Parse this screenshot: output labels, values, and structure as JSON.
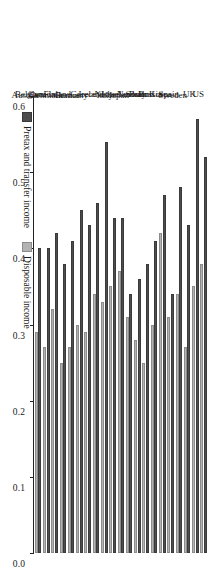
{
  "chart_data": {
    "type": "bar",
    "orientation": "horizontal",
    "title": "",
    "subtitle": "",
    "xlabel": "",
    "ylabel": "",
    "xlim": [
      0.0,
      0.6
    ],
    "xticks": [
      "0.0",
      "0.1",
      "0.2",
      "0.3",
      "0.4",
      "0.5",
      "0.6"
    ],
    "xtick_values": [
      0.0,
      0.1,
      0.2,
      0.3,
      0.4,
      0.5,
      0.6
    ],
    "axis_reversed": true,
    "grid": false,
    "legend_position": "bottom-left",
    "categories": [
      "Austria",
      "Belgium",
      "Canada",
      "Denmark",
      "Finland",
      "France",
      "Germany",
      "Greece",
      "Ireland",
      "Italy",
      "Israel",
      "Japan",
      "Netherlands",
      "Norway",
      "Poland",
      "Russia",
      "South Korea",
      "Spain",
      "Sweden",
      "UK",
      "US"
    ],
    "series": [
      {
        "name": "Pretax and transfer income",
        "color": "#4d4d4d",
        "values": [
          0.4,
          0.4,
          0.42,
          0.38,
          0.41,
          0.45,
          0.43,
          0.46,
          0.54,
          0.44,
          0.44,
          0.34,
          0.36,
          0.38,
          0.41,
          0.47,
          0.34,
          0.48,
          0.43,
          0.57,
          0.52
        ]
      },
      {
        "name": "Disposable income",
        "color": "#b3b3b3",
        "values": [
          0.29,
          0.27,
          0.32,
          0.25,
          0.27,
          0.3,
          0.29,
          0.34,
          0.33,
          0.35,
          0.37,
          0.31,
          0.28,
          0.25,
          0.3,
          0.42,
          0.31,
          0.34,
          0.27,
          0.35,
          0.38
        ]
      }
    ]
  },
  "legend": {
    "entries": [
      {
        "label": "Pretax and transfer income",
        "color": "#4d4d4d"
      },
      {
        "label": "Disposable income",
        "color": "#b3b3b3"
      }
    ]
  },
  "colors": {
    "pretax": "#4d4d4d",
    "disposable": "#b3b3b3",
    "axis": "#222222",
    "background": "#ffffff"
  }
}
